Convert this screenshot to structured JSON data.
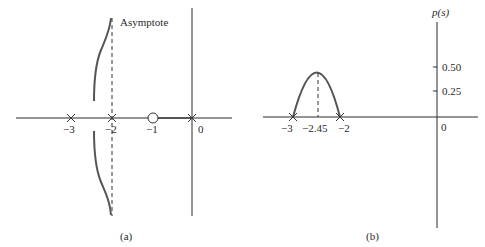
{
  "panel_a": {
    "caption": "(a)",
    "asymptote_label": "Asymptote",
    "tick_labels": [
      "−3",
      "−2",
      "−1",
      "0"
    ],
    "poles": [
      -3,
      -2,
      0
    ],
    "zeros": [
      -1
    ],
    "asymptote_at": -2
  },
  "panel_b": {
    "caption": "(b)",
    "y_axis_label": "p(s)",
    "x_tick_labels": [
      "−3",
      "−2.45",
      "−2"
    ],
    "origin_label": "0",
    "y_tick_labels": [
      "0.50",
      "0.25"
    ],
    "breakaway_point": -2.45,
    "roots": [
      -3,
      -2
    ]
  },
  "colors": {
    "line": "#2a2a2a",
    "curve": "#555555"
  }
}
